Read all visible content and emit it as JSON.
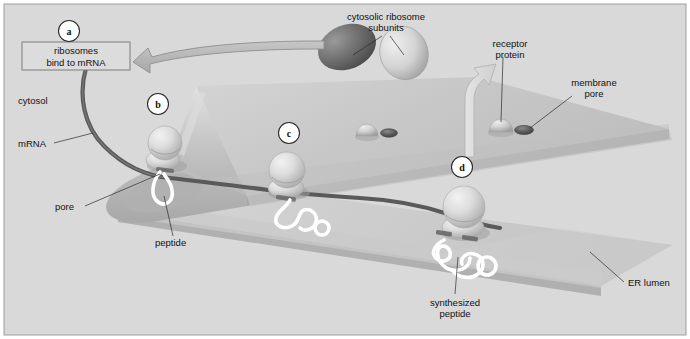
{
  "figure": {
    "width": 690,
    "height": 339,
    "background_color": "#d8d8d8",
    "border_color": "#9a9a9a"
  },
  "colors": {
    "background": "#d9d9d9",
    "membrane_top": "#c9c9c9",
    "membrane_top_light": "#d2d2d2",
    "membrane_edge": "#b4b4b4",
    "lumen_sheet": "#c2c2c2",
    "lumen_sheet_light": "#cfcfcf",
    "mrna_strand": "#5a5a5a",
    "peptide": "#ffffff",
    "ribosome_light": "#d7d7d7",
    "ribosome_dark": "#6e6e6e",
    "pore_dark": "#555555",
    "arrow_fill": "#b9b9b9",
    "arrow_stroke": "#8d8d8d",
    "white_arrow_fill": "#dcdcdc",
    "label_text": "#111111",
    "leader_line": "#2b2b2b",
    "box_stroke": "#7a7a7a"
  },
  "callout_box": {
    "name": "ribosomes-bind-box",
    "line1": "ribosomes",
    "line2": "bind to mRNA",
    "x": 22,
    "y": 42,
    "width": 108,
    "height": 28
  },
  "step_markers": [
    {
      "id": "a",
      "label": "a",
      "cx": 69,
      "cy": 31
    },
    {
      "id": "b",
      "label": "b",
      "cx": 158,
      "cy": 104
    },
    {
      "id": "c",
      "label": "c",
      "cx": 289,
      "cy": 133
    },
    {
      "id": "d",
      "label": "d",
      "cx": 462,
      "cy": 167
    }
  ],
  "labels": [
    {
      "name": "label-cytosol",
      "text": "cytosol",
      "x": 18,
      "y": 101,
      "anchor": "start",
      "lines": [
        "cytosol"
      ]
    },
    {
      "name": "label-mrna",
      "text": "mRNA",
      "x": 18,
      "y": 146,
      "anchor": "start",
      "lines": [
        "mRNA"
      ]
    },
    {
      "name": "label-pore",
      "text": "pore",
      "x": 55,
      "y": 209,
      "anchor": "start",
      "lines": [
        "pore"
      ]
    },
    {
      "name": "label-peptide",
      "text": "peptide",
      "x": 155,
      "y": 244,
      "anchor": "start",
      "lines": [
        "peptide"
      ]
    },
    {
      "name": "label-cytosolic-subunits",
      "text": "cytosolic ribosome subunits",
      "x": 386,
      "y": 19,
      "anchor": "middle",
      "lines": [
        "cytosolic ribosome",
        "subunits"
      ]
    },
    {
      "name": "label-receptor-protein",
      "text": "receptor protein",
      "x": 510,
      "y": 46,
      "anchor": "middle",
      "lines": [
        "receptor",
        "protein"
      ]
    },
    {
      "name": "label-membrane-pore",
      "text": "membrane pore",
      "x": 592,
      "y": 85,
      "anchor": "middle",
      "lines": [
        "membrane",
        "pore"
      ]
    },
    {
      "name": "label-synthesized-peptide",
      "text": "synthesized peptide",
      "x": 455,
      "y": 309,
      "anchor": "middle",
      "lines": [
        "synthesized",
        "peptide"
      ]
    },
    {
      "name": "label-er-lumen",
      "text": "ER lumen",
      "x": 628,
      "y": 285,
      "anchor": "start",
      "lines": [
        "ER lumen"
      ]
    }
  ],
  "structures": {
    "ribosomes_on_membrane": [
      {
        "name": "ribosome-b",
        "cx": 165,
        "cy": 143,
        "r": 17
      },
      {
        "name": "ribosome-c",
        "cx": 287,
        "cy": 170,
        "r": 18
      },
      {
        "name": "ribosome-d",
        "cx": 464,
        "cy": 207,
        "r": 21
      }
    ],
    "free_subunits": [
      {
        "name": "ribosome-subunit-large-dark",
        "cx": 347,
        "cy": 47,
        "rx": 30,
        "ry": 22,
        "shade": "dark",
        "rotation": -22
      },
      {
        "name": "ribosome-subunit-small-light",
        "cx": 404,
        "cy": 52,
        "rx": 25,
        "ry": 27,
        "shade": "light",
        "rotation": -18
      }
    ],
    "receptor_proteins": [
      {
        "name": "receptor-protein-1",
        "cx": 367,
        "cy": 128,
        "r": 11
      },
      {
        "name": "receptor-protein-2",
        "cx": 501,
        "cy": 124,
        "r": 12
      }
    ],
    "membrane_pores": [
      {
        "name": "membrane-pore-1",
        "cx": 389,
        "cy": 133,
        "rx": 8,
        "ry": 4
      },
      {
        "name": "membrane-pore-2",
        "cx": 524,
        "cy": 130,
        "rx": 9,
        "ry": 4.5
      }
    ]
  },
  "arrows": {
    "recycle_arrow": {
      "name": "recycle-arrow",
      "direction": "left",
      "description": "curved grey arrow from ribosome subunits to ribosomes-bind-to-mRNA box"
    },
    "release_arrow": {
      "name": "subunit-release-arrow",
      "direction": "up",
      "description": "pale curved arrow from step d up to cytosolic ribosome subunits"
    }
  }
}
